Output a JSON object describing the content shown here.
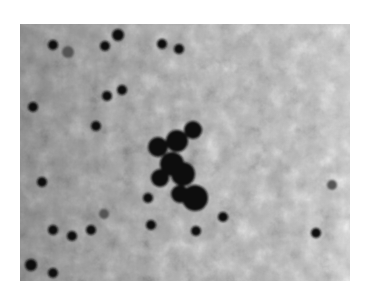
{
  "figure": {
    "type": "grayscale micrograph",
    "background_color": "#b9b9b9",
    "particle_color": "#111111",
    "frame": {
      "x": 20,
      "y": 24,
      "width": 330,
      "height": 257
    }
  },
  "particles": [
    {
      "x": 33,
      "y": 21,
      "r": 5
    },
    {
      "x": 48,
      "y": 28,
      "r": 6,
      "faint": true
    },
    {
      "x": 85,
      "y": 22,
      "r": 5
    },
    {
      "x": 98,
      "y": 11,
      "r": 6
    },
    {
      "x": 142,
      "y": 20,
      "r": 5
    },
    {
      "x": 159,
      "y": 25,
      "r": 5
    },
    {
      "x": 87,
      "y": 72,
      "r": 5
    },
    {
      "x": 102,
      "y": 66,
      "r": 5
    },
    {
      "x": 13,
      "y": 83,
      "r": 5
    },
    {
      "x": 76,
      "y": 102,
      "r": 5
    },
    {
      "x": 22,
      "y": 158,
      "r": 5
    },
    {
      "x": 128,
      "y": 174,
      "r": 5
    },
    {
      "x": 84,
      "y": 190,
      "r": 5,
      "faint": true
    },
    {
      "x": 33,
      "y": 206,
      "r": 5
    },
    {
      "x": 52,
      "y": 212,
      "r": 5
    },
    {
      "x": 71,
      "y": 206,
      "r": 5
    },
    {
      "x": 131,
      "y": 201,
      "r": 5
    },
    {
      "x": 176,
      "y": 207,
      "r": 5
    },
    {
      "x": 203,
      "y": 193,
      "r": 5
    },
    {
      "x": 296,
      "y": 209,
      "r": 5
    },
    {
      "x": 312,
      "y": 161,
      "r": 5,
      "faint": true
    },
    {
      "x": 11,
      "y": 241,
      "r": 6
    },
    {
      "x": 33,
      "y": 249,
      "r": 5
    }
  ],
  "cluster": [
    {
      "x": 138,
      "y": 123,
      "r": 10
    },
    {
      "x": 157,
      "y": 117,
      "r": 11
    },
    {
      "x": 173,
      "y": 106,
      "r": 9
    },
    {
      "x": 152,
      "y": 140,
      "r": 12
    },
    {
      "x": 163,
      "y": 150,
      "r": 12
    },
    {
      "x": 140,
      "y": 154,
      "r": 9
    },
    {
      "x": 175,
      "y": 174,
      "r": 13
    },
    {
      "x": 160,
      "y": 170,
      "r": 9
    }
  ]
}
